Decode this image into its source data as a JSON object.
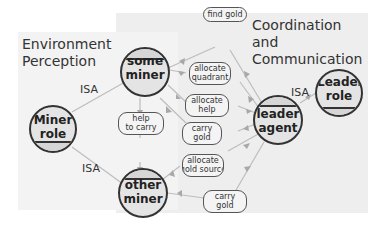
{
  "panels": {
    "environment": {
      "title_line1": "Environment",
      "title_line2": "Perception"
    },
    "coordination": {
      "title_line1": "Coordination and",
      "title_line2": "Communication"
    }
  },
  "nodes": {
    "some_miner": {
      "line1": "some",
      "line2": "miner"
    },
    "miner_role": {
      "line1": "Miner",
      "line2": "role"
    },
    "other_miner": {
      "line1": "other",
      "line2": "miner"
    },
    "leader_agent": {
      "line1": "leader",
      "line2": "agent"
    },
    "leader_role": {
      "line1": "Leader",
      "line2": "role"
    }
  },
  "messages": [
    {
      "line1": "find gold",
      "line2": ""
    },
    {
      "line1": "allocate",
      "line2": "quadrant"
    },
    {
      "line1": "allocate",
      "line2": "help"
    },
    {
      "line1": "carry",
      "line2": "gold"
    },
    {
      "line1": "help",
      "line2": "to carry"
    },
    {
      "line1": "allocate",
      "line2": "gold source"
    },
    {
      "line1": "carry",
      "line2": "gold"
    }
  ],
  "edge_labels": {
    "isa_top": "ISA",
    "isa_bottom": "ISA",
    "isa_leader": "ISA"
  },
  "colors": {
    "edge": "#b8b8b8",
    "node_fill": "#e8e8e8",
    "node_stroke": "#333333",
    "arrow": "#a8a8a8"
  }
}
